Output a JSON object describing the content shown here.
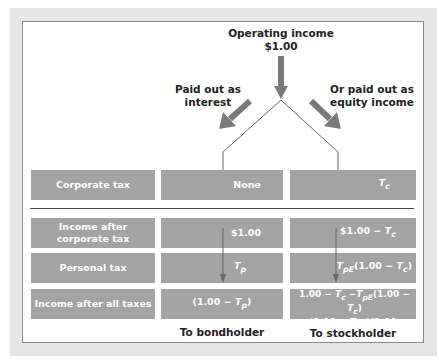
{
  "diagram": {
    "top_label": {
      "line1": "Operating income",
      "line2": "$1.00"
    },
    "left_branch_label": {
      "line1": "Paid out as",
      "line2": "interest"
    },
    "right_branch_label": {
      "line1": "Or paid out as",
      "line2": "equity income"
    },
    "rows": [
      {
        "label": "Corporate tax",
        "bond": "None",
        "stock": "Tc"
      },
      {
        "label": "Income after corporate tax",
        "bond": "$1.00",
        "stock": "$1.00 − Tc"
      },
      {
        "label": "Personal tax",
        "bond": "Tp",
        "stock": "TpE(1.00 − Tc)"
      },
      {
        "label": "Income after all taxes",
        "bond": "(1.00 − Tp)",
        "stock": "1.00 − Tc − TpE(1.00 − Tc) = (1.00 − TpE)(1.00 − Tc)"
      }
    ],
    "rows_display": {
      "r0_label": "Corporate tax",
      "r0_bond": "None",
      "r1_label_l1": "Income after",
      "r1_label_l2": "corporate tax",
      "r1_bond": "$1.00",
      "r1_stock_pre": "$1.00 −",
      "r2_label": "Personal tax",
      "r2_stock_post": "(1.00 −",
      "r2_stock_end": ")",
      "r3_label": "Income after all taxes",
      "r3_bond_pre": "(1.00 −",
      "r3_bond_end": ")",
      "r3_stock_l1_pre": "1.00 −",
      "r3_stock_l1_mid": " −",
      "r3_stock_l1_post": "(1.00 −",
      "r3_stock_l1_end": ")",
      "r3_stock_l2_pre": "=(1.00 −",
      "r3_stock_l2_mid": ")(1.00 −",
      "r3_stock_l2_end": ")"
    },
    "symbols": {
      "T": "T",
      "c": "c",
      "p": "p",
      "pE": "pE"
    },
    "bottom_labels": {
      "bond": "To bondholder",
      "stock": "To stockholder"
    },
    "colors": {
      "box": "#a3a3a3",
      "arrow": "#7a7a7a",
      "frame": "#e6e6e6",
      "line": "#555555"
    }
  }
}
